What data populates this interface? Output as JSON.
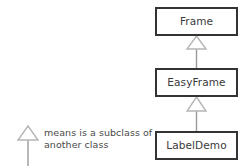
{
  "diagram": {
    "type": "uml-class-hierarchy",
    "title": "",
    "classes": [
      {
        "id": "frame",
        "label": "Frame",
        "x": 155,
        "y": 7,
        "width": 83,
        "height": 29
      },
      {
        "id": "easyframe",
        "label": "EasyFrame",
        "x": 155,
        "y": 68,
        "width": 83,
        "height": 29
      },
      {
        "id": "labeldemo",
        "label": "LabelDemo",
        "x": 155,
        "y": 131,
        "width": 83,
        "height": 29
      }
    ],
    "relations": [
      {
        "from": "easyframe",
        "to": "frame",
        "kind": "inheritance"
      },
      {
        "from": "labeldemo",
        "to": "easyframe",
        "kind": "inheritance"
      }
    ],
    "legend": {
      "arrow_icon": "hollow-triangle-arrow-icon",
      "line1": "means is a subclass of",
      "line2": "another class"
    },
    "colors": {
      "background": "#ffffff",
      "box_border": "#333333",
      "box_fill": "#ffffff",
      "label_text": "#3a3a3a",
      "legend_text": "#4a4a4a",
      "connector_line": "#9a9a9a",
      "arrow_outline": "#b5b5b5",
      "arrow_fill": "#ffffff"
    }
  }
}
